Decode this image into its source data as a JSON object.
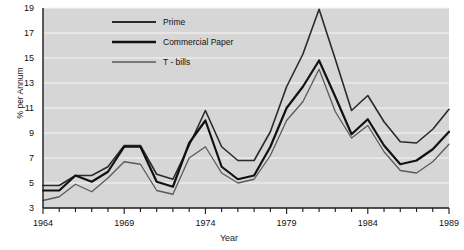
{
  "chart_data": {
    "type": "line",
    "title": "",
    "xlabel": "Year",
    "ylabel": "% per Annum",
    "xlim": [
      1964,
      1989
    ],
    "ylim": [
      3,
      19
    ],
    "grid": true,
    "legend_position": "top-left-inside",
    "x": [
      1964,
      1965,
      1966,
      1967,
      1968,
      1969,
      1970,
      1971,
      1972,
      1973,
      1974,
      1975,
      1976,
      1977,
      1978,
      1979,
      1980,
      1981,
      1982,
      1983,
      1984,
      1985,
      1986,
      1987,
      1988,
      1989
    ],
    "xticks": [
      1964,
      1969,
      1974,
      1979,
      1984,
      1989
    ],
    "xtick_labels": [
      "1964",
      "1969",
      "1974",
      "1979",
      "1984",
      "1989"
    ],
    "yticks": [
      3,
      5,
      7,
      9,
      11,
      13,
      15,
      17,
      19
    ],
    "ytick_labels": [
      "3",
      "5",
      "7",
      "9",
      "11",
      "13",
      "15",
      "17",
      "19"
    ],
    "series": [
      {
        "name": "Prime",
        "color": "#2a2a2a",
        "width": 1.6,
        "values": [
          4.8,
          4.8,
          5.6,
          5.6,
          6.3,
          8.0,
          8.0,
          5.7,
          5.3,
          8.0,
          10.8,
          7.9,
          6.8,
          6.8,
          9.1,
          12.7,
          15.3,
          18.9,
          14.9,
          10.8,
          12.0,
          9.9,
          8.3,
          8.2,
          9.3,
          10.9
        ]
      },
      {
        "name": "Commercial Paper",
        "color": "#111111",
        "width": 2.2,
        "values": [
          4.4,
          4.4,
          5.6,
          5.1,
          5.9,
          7.9,
          7.9,
          5.1,
          4.7,
          8.2,
          10.0,
          6.3,
          5.3,
          5.6,
          7.9,
          11.0,
          12.7,
          14.8,
          11.9,
          8.9,
          10.1,
          8.0,
          6.5,
          6.8,
          7.7,
          9.1
        ]
      },
      {
        "name": "T - bills",
        "color": "#5a5a5a",
        "width": 1.3,
        "values": [
          3.6,
          3.9,
          4.9,
          4.3,
          5.4,
          6.7,
          6.5,
          4.4,
          4.1,
          7.0,
          7.9,
          5.8,
          5.0,
          5.3,
          7.2,
          10.0,
          11.5,
          14.1,
          10.7,
          8.6,
          9.6,
          7.5,
          6.0,
          5.8,
          6.7,
          8.1
        ]
      }
    ]
  },
  "axes": {
    "y_title": "% per Annum",
    "x_title": "Year"
  },
  "legend": {
    "items": [
      {
        "label": "Prime"
      },
      {
        "label": "Commercial Paper"
      },
      {
        "label": "T - bills"
      }
    ]
  },
  "colors": {
    "plot_background": "#d6d6d6",
    "gridline": "#f5f5f5",
    "axis": "#1a1a1a",
    "page_background": "#ffffff"
  }
}
